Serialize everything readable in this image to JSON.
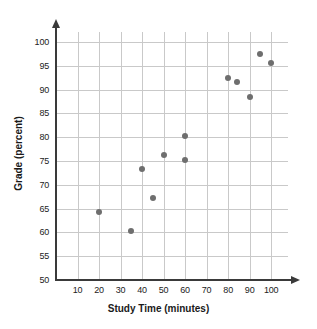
{
  "chart_data": {
    "type": "scatter",
    "title": "",
    "xlabel": "Study Time (minutes)",
    "ylabel": "Grade (percent)",
    "xlim": [
      0,
      105
    ],
    "ylim": [
      50,
      103
    ],
    "xticks": [
      10,
      20,
      30,
      40,
      50,
      60,
      70,
      80,
      90,
      100
    ],
    "yticks": [
      50,
      55,
      60,
      65,
      70,
      75,
      80,
      85,
      90,
      95,
      100
    ],
    "grid": true,
    "legend": null,
    "point_color": "#6e6e6e",
    "axis_color": "#3a3a3a",
    "grid_color": "#c9c9c9",
    "points": [
      {
        "x": 20,
        "y": 64.3
      },
      {
        "x": 35,
        "y": 60.3
      },
      {
        "x": 40,
        "y": 73.3
      },
      {
        "x": 45,
        "y": 67.3
      },
      {
        "x": 50,
        "y": 76.3
      },
      {
        "x": 60,
        "y": 75.3
      },
      {
        "x": 60,
        "y": 80.3
      },
      {
        "x": 80,
        "y": 92.5
      },
      {
        "x": 84,
        "y": 91.5
      },
      {
        "x": 90,
        "y": 88.5
      },
      {
        "x": 95,
        "y": 97.5
      },
      {
        "x": 100,
        "y": 95.5
      }
    ]
  }
}
